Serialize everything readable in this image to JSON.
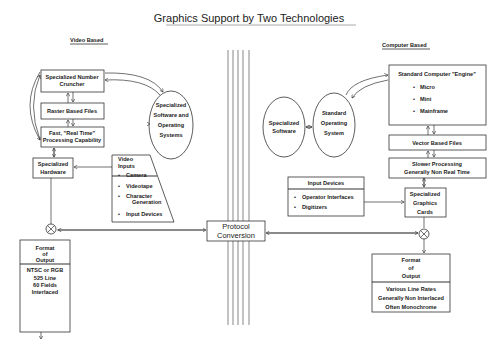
{
  "title": "Graphics Support by Two Technologies",
  "left": {
    "heading": "Video Based",
    "number_cruncher": [
      "Specialized Number",
      "Cruncher"
    ],
    "raster_files": "Raster Based Files",
    "fast_processing": [
      "Fast, \"Real Time\"",
      "Processing Capability"
    ],
    "software_os": [
      "Specialized",
      "Software and",
      "Operating",
      "Systems"
    ],
    "hardware": [
      "Specialized",
      "Hardware"
    ],
    "video_inputs": {
      "title": [
        "Video",
        "Inputs"
      ],
      "items": [
        "Camera",
        "Videotape",
        "Character",
        "Generation",
        "Input Devices"
      ]
    },
    "format_output": {
      "title": [
        "Format",
        "of",
        "Output"
      ],
      "details": [
        "NTSC or RGB",
        "525 Line",
        "60 Fields",
        "Interlaced"
      ]
    }
  },
  "center": {
    "protocol": [
      "Protocol",
      "Conversion"
    ]
  },
  "right": {
    "heading": "Computer Based",
    "engine": {
      "title": "Standard Computer \"Engine\"",
      "items": [
        "Micro",
        "Mini",
        "Mainframe"
      ]
    },
    "vector_files": "Vector Based Files",
    "slower_processing": [
      "Slower Processing",
      "Generally Non Real Time"
    ],
    "specialized_software": [
      "Specialized",
      "Software"
    ],
    "standard_os": [
      "Standard",
      "Operating",
      "System"
    ],
    "input_devices": {
      "title": "Input Devices",
      "items": [
        "Operator Interfaces",
        "Digitizers"
      ]
    },
    "graphics_cards": [
      "Specialized",
      "Graphics",
      "Cards"
    ],
    "format_output": {
      "title": [
        "Format",
        "of",
        "Output"
      ],
      "details": [
        "Various Line Rates",
        "Generally Non Interlaced",
        "Often Monochrome"
      ]
    }
  }
}
